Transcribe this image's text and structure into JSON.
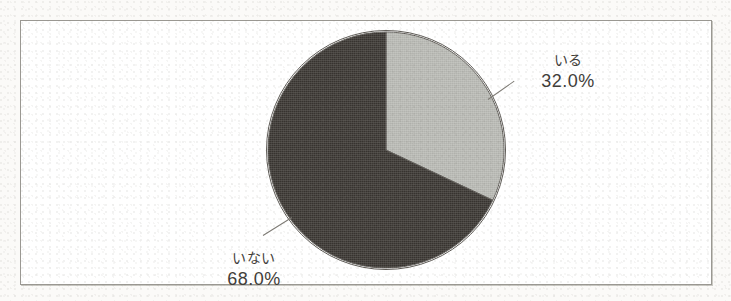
{
  "figure": {
    "background_color": "#fbfaf8",
    "frame_color": "#9a9892",
    "frame_fill": "#ffffff"
  },
  "chart_data": {
    "type": "pie",
    "title": "",
    "subtitle": "",
    "xlabel": "",
    "ylabel": "",
    "legend_position": "none",
    "grid": false,
    "start_angle_deg": 0,
    "direction": "clockwise",
    "categories": [
      "いる",
      "いない"
    ],
    "values": [
      32.0,
      68.0
    ],
    "value_unit": "%",
    "slices": [
      {
        "label": "いる",
        "value": 32.0,
        "value_text": "32.0%",
        "color": "#b9bab5",
        "start_deg": 0.0,
        "end_deg": 115.2,
        "label_position": "right-top"
      },
      {
        "label": "いない",
        "value": 68.0,
        "value_text": "68.0%",
        "color": "#3a3632",
        "start_deg": 115.2,
        "end_deg": 360.0,
        "label_position": "left-bottom"
      }
    ],
    "colors": {
      "slice_light": "#b9bab5",
      "slice_dark": "#3a3632",
      "outline": "#5d5a55",
      "leader_line": "#7d7a74",
      "text": "#3f3d39"
    }
  }
}
